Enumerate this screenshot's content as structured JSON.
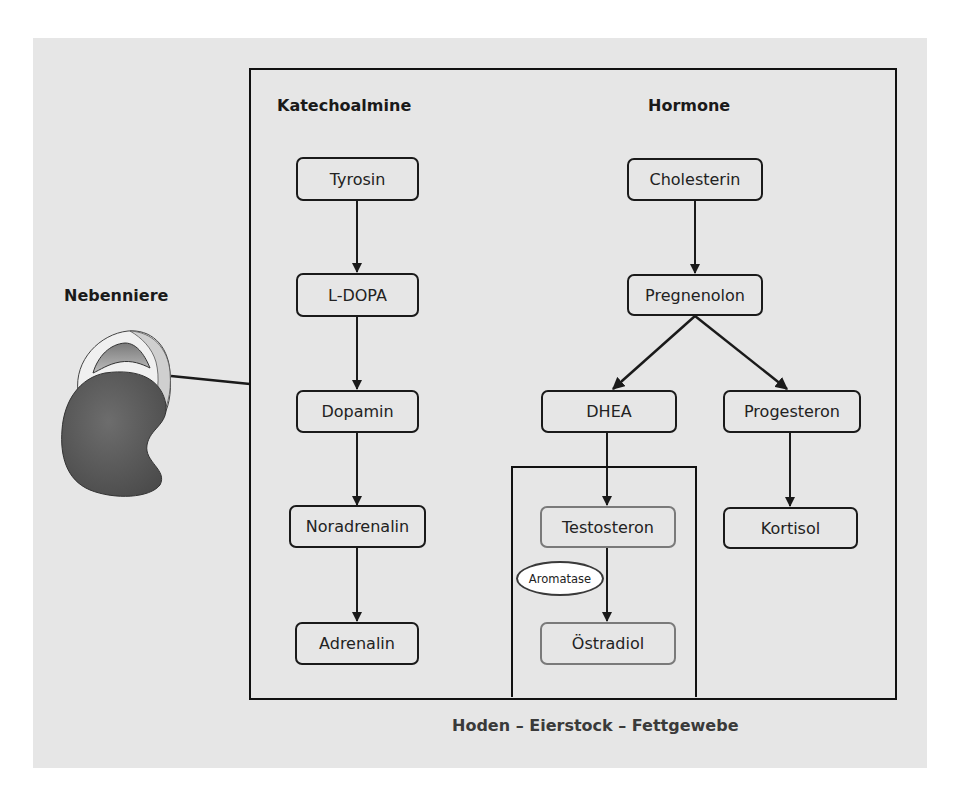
{
  "diagram": {
    "organ_label": "Nebenniere",
    "organ_icon": "adrenal-gland-kidney-illustration",
    "columns": {
      "left_heading": "Katechoalmine",
      "right_heading": "Hormone"
    },
    "catecholamine_pathway": [
      {
        "id": "tyrosin",
        "label": "Tyrosin"
      },
      {
        "id": "l-dopa",
        "label": "L-DOPA"
      },
      {
        "id": "dopamin",
        "label": "Dopamin"
      },
      {
        "id": "noradrenalin",
        "label": "Noradrenalin"
      },
      {
        "id": "adrenalin",
        "label": "Adrenalin"
      }
    ],
    "hormone_pathway": {
      "cholesterin": "Cholesterin",
      "pregnenolon": "Pregnenolon",
      "dhea": "DHEA",
      "progesteron": "Progesteron",
      "kortisol": "Kortisol",
      "testosteron": "Testosteron",
      "oestradiol": "Östradiol",
      "enzyme": "Aromatase"
    },
    "edges": [
      [
        "Tyrosin",
        "L-DOPA"
      ],
      [
        "L-DOPA",
        "Dopamin"
      ],
      [
        "Dopamin",
        "Noradrenalin"
      ],
      [
        "Noradrenalin",
        "Adrenalin"
      ],
      [
        "Cholesterin",
        "Pregnenolon"
      ],
      [
        "Pregnenolon",
        "DHEA"
      ],
      [
        "Pregnenolon",
        "Progesteron"
      ],
      [
        "DHEA",
        "Testosteron"
      ],
      [
        "Testosteron",
        "Östradiol"
      ],
      [
        "Progesteron",
        "Kortisol"
      ]
    ],
    "peripheral_tissue_label": "Hoden – Eierstock – Fettgewebe",
    "colors": {
      "background_panel": "#e6e6e6",
      "stroke": "#1a1a1a",
      "peripheral_node_border": "#7a7a7a",
      "enzyme_fill": "#ffffff",
      "organ_dark": "#5a5a5a",
      "organ_light": "#d8d8d8"
    }
  }
}
